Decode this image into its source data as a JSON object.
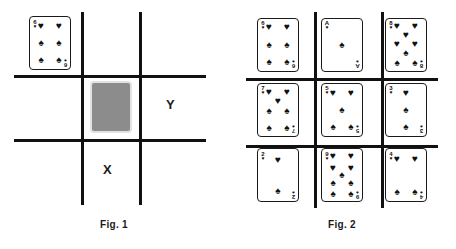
{
  "figures": [
    {
      "id": "fig1",
      "caption": "Fig. 1",
      "cell_labels": [
        {
          "name": "x",
          "text": "X"
        },
        {
          "name": "y",
          "text": "Y"
        }
      ],
      "face_down_card": {
        "label": "face-down card",
        "color": "#8c8c8c"
      },
      "loose_card": {
        "rank": "6",
        "top_suit": "♥",
        "bottom_suit": "♠",
        "top_pips": 2,
        "bottom_pips": 4,
        "total_pips": 6
      }
    },
    {
      "id": "fig2",
      "caption": "Fig. 2",
      "cards": [
        {
          "rank": "6",
          "top_suit": "♥",
          "bottom_suit": "♠",
          "total_pips": 6
        },
        {
          "rank": "A",
          "top_suit": "♥",
          "bottom_suit": "♠",
          "total_pips": 1
        },
        {
          "rank": "8",
          "top_suit": "♥",
          "bottom_suit": "♠",
          "total_pips": 8
        },
        {
          "rank": "7",
          "top_suit": "♥",
          "bottom_suit": "♠",
          "total_pips": 7
        },
        {
          "rank": "5",
          "top_suit": "♥",
          "bottom_suit": "♠",
          "total_pips": 5
        },
        {
          "rank": "3",
          "top_suit": "♥",
          "bottom_suit": "♠",
          "total_pips": 3
        },
        {
          "rank": "2",
          "top_suit": "♥",
          "bottom_suit": "♠",
          "total_pips": 2
        },
        {
          "rank": "9",
          "top_suit": "♥",
          "bottom_suit": "♠",
          "total_pips": 9
        },
        {
          "rank": "4",
          "top_suit": "♥",
          "bottom_suit": "♠",
          "total_pips": 4
        }
      ]
    }
  ],
  "colors": {
    "ink": "#111111",
    "paper": "#ffffff",
    "card_back_gray": "#8c8c8c"
  }
}
